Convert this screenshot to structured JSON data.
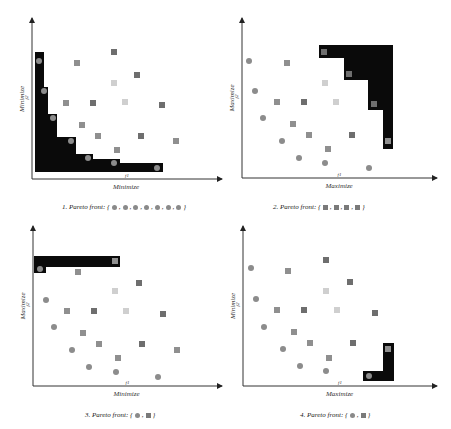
{
  "colors": {
    "front_fill": "#0a0a0a",
    "circle": "#8c8c8c",
    "square_dark": "#6e6e6e",
    "square_mid": "#8f8f8f",
    "square_light": "#cfcfcf",
    "axis": "#333333"
  },
  "panels": [
    {
      "id": 1,
      "caption": "1. Pareto front: {",
      "caption_end": "}",
      "front_symbols": [
        "circle",
        "circle",
        "circle",
        "circle",
        "circle",
        "circle",
        "circle"
      ],
      "x_axis_label": "Minimize",
      "y_axis_label": "Minimize",
      "x_tick": "f1",
      "y_tick": "f2",
      "axes": {
        "ox": 32,
        "oy": 179,
        "xend": 222,
        "ytop": 18
      },
      "front_polygon": [
        [
          35,
          52
        ],
        [
          44,
          52
        ],
        [
          44,
          87
        ],
        [
          48,
          87
        ],
        [
          48,
          114
        ],
        [
          57,
          114
        ],
        [
          57,
          137
        ],
        [
          76,
          137
        ],
        [
          76,
          154
        ],
        [
          93,
          154
        ],
        [
          93,
          159
        ],
        [
          120,
          159
        ],
        [
          120,
          163
        ],
        [
          163,
          163
        ],
        [
          163,
          172
        ],
        [
          35,
          172
        ]
      ],
      "circles": [
        [
          39,
          61
        ],
        [
          44,
          91
        ],
        [
          53,
          118
        ],
        [
          71,
          141
        ],
        [
          88,
          158
        ],
        [
          114,
          163
        ],
        [
          157,
          168
        ]
      ],
      "squares": [
        {
          "x": 114,
          "y": 52,
          "tone": "dark"
        },
        {
          "x": 77,
          "y": 63,
          "tone": "mid"
        },
        {
          "x": 137,
          "y": 75,
          "tone": "dark"
        },
        {
          "x": 114,
          "y": 83,
          "tone": "light"
        },
        {
          "x": 66,
          "y": 103,
          "tone": "mid"
        },
        {
          "x": 93,
          "y": 103,
          "tone": "dark"
        },
        {
          "x": 125,
          "y": 102,
          "tone": "light"
        },
        {
          "x": 162,
          "y": 105,
          "tone": "dark"
        },
        {
          "x": 82,
          "y": 125,
          "tone": "mid"
        },
        {
          "x": 98,
          "y": 136,
          "tone": "mid"
        },
        {
          "x": 141,
          "y": 136,
          "tone": "dark"
        },
        {
          "x": 176,
          "y": 141,
          "tone": "mid"
        },
        {
          "x": 117,
          "y": 150,
          "tone": "mid"
        }
      ],
      "caption_pos": {
        "x": 62,
        "y": 203
      }
    },
    {
      "id": 2,
      "caption": "2. Pareto front: {",
      "caption_end": "}",
      "front_symbols": [
        "square",
        "square",
        "square",
        "square"
      ],
      "x_axis_label": "Maximize",
      "y_axis_label": "Maximize",
      "x_tick": "f1",
      "y_tick": "f2",
      "axes": {
        "ox": 242,
        "oy": 178,
        "xend": 437,
        "ytop": 18
      },
      "front_polygon": [
        [
          319,
          45
        ],
        [
          393,
          45
        ],
        [
          393,
          149
        ],
        [
          383,
          149
        ],
        [
          383,
          110
        ],
        [
          368,
          110
        ],
        [
          368,
          80
        ],
        [
          344,
          80
        ],
        [
          344,
          58
        ],
        [
          319,
          58
        ]
      ],
      "circles": [
        [
          249,
          61
        ],
        [
          255,
          91
        ],
        [
          263,
          118
        ],
        [
          282,
          141
        ],
        [
          299,
          158
        ],
        [
          325,
          163
        ],
        [
          369,
          168
        ]
      ],
      "squares": [
        {
          "x": 324,
          "y": 52,
          "tone": "dark"
        },
        {
          "x": 287,
          "y": 63,
          "tone": "mid"
        },
        {
          "x": 349,
          "y": 74,
          "tone": "dark"
        },
        {
          "x": 325,
          "y": 83,
          "tone": "light"
        },
        {
          "x": 277,
          "y": 102,
          "tone": "mid"
        },
        {
          "x": 304,
          "y": 102,
          "tone": "dark"
        },
        {
          "x": 336,
          "y": 102,
          "tone": "light"
        },
        {
          "x": 374,
          "y": 104,
          "tone": "dark"
        },
        {
          "x": 293,
          "y": 124,
          "tone": "mid"
        },
        {
          "x": 309,
          "y": 135,
          "tone": "mid"
        },
        {
          "x": 352,
          "y": 135,
          "tone": "dark"
        },
        {
          "x": 388,
          "y": 141,
          "tone": "mid"
        },
        {
          "x": 328,
          "y": 149,
          "tone": "mid"
        }
      ],
      "caption_pos": {
        "x": 273,
        "y": 203
      }
    },
    {
      "id": 3,
      "caption": "3. Pareto front: {",
      "caption_end": "}",
      "front_symbols": [
        "circle",
        "square"
      ],
      "x_axis_label": "Minimize",
      "y_axis_label": "Maximize",
      "x_tick": "f1",
      "y_tick": "f2",
      "axes": {
        "ox": 33,
        "oy": 386,
        "xend": 222,
        "ytop": 226
      },
      "front_polygon": [
        [
          34,
          256
        ],
        [
          120,
          256
        ],
        [
          120,
          267
        ],
        [
          46,
          267
        ],
        [
          46,
          273
        ],
        [
          34,
          273
        ]
      ],
      "circles": [
        [
          40,
          269
        ],
        [
          46,
          300
        ],
        [
          54,
          327
        ],
        [
          72,
          350
        ],
        [
          89,
          367
        ],
        [
          116,
          372
        ],
        [
          158,
          377
        ]
      ],
      "squares": [
        {
          "x": 115,
          "y": 261,
          "tone": "mid"
        },
        {
          "x": 78,
          "y": 272,
          "tone": "mid"
        },
        {
          "x": 139,
          "y": 283,
          "tone": "dark"
        },
        {
          "x": 115,
          "y": 291,
          "tone": "light"
        },
        {
          "x": 67,
          "y": 311,
          "tone": "mid"
        },
        {
          "x": 94,
          "y": 311,
          "tone": "dark"
        },
        {
          "x": 126,
          "y": 311,
          "tone": "light"
        },
        {
          "x": 163,
          "y": 314,
          "tone": "dark"
        },
        {
          "x": 83,
          "y": 333,
          "tone": "mid"
        },
        {
          "x": 99,
          "y": 344,
          "tone": "mid"
        },
        {
          "x": 142,
          "y": 344,
          "tone": "dark"
        },
        {
          "x": 177,
          "y": 350,
          "tone": "mid"
        },
        {
          "x": 118,
          "y": 358,
          "tone": "mid"
        }
      ],
      "caption_pos": {
        "x": 85,
        "y": 411
      }
    },
    {
      "id": 4,
      "caption": "4. Pareto front: {",
      "caption_end": "}",
      "front_symbols": [
        "circle",
        "square"
      ],
      "x_axis_label": "Maximize",
      "y_axis_label": "Minimize",
      "x_tick": "f1",
      "y_tick": "f2",
      "axes": {
        "ox": 243,
        "oy": 386,
        "xend": 437,
        "ytop": 226
      },
      "front_polygon": [
        [
          363,
          371
        ],
        [
          383,
          371
        ],
        [
          383,
          343
        ],
        [
          394,
          343
        ],
        [
          394,
          381
        ],
        [
          363,
          381
        ]
      ],
      "circles": [
        [
          251,
          268
        ],
        [
          256,
          299
        ],
        [
          264,
          327
        ],
        [
          283,
          349
        ],
        [
          300,
          366
        ],
        [
          326,
          371
        ],
        [
          369,
          376
        ]
      ],
      "squares": [
        {
          "x": 326,
          "y": 260,
          "tone": "dark"
        },
        {
          "x": 288,
          "y": 271,
          "tone": "mid"
        },
        {
          "x": 350,
          "y": 282,
          "tone": "dark"
        },
        {
          "x": 326,
          "y": 291,
          "tone": "light"
        },
        {
          "x": 277,
          "y": 310,
          "tone": "mid"
        },
        {
          "x": 304,
          "y": 310,
          "tone": "dark"
        },
        {
          "x": 337,
          "y": 310,
          "tone": "light"
        },
        {
          "x": 375,
          "y": 313,
          "tone": "dark"
        },
        {
          "x": 294,
          "y": 332,
          "tone": "mid"
        },
        {
          "x": 310,
          "y": 343,
          "tone": "mid"
        },
        {
          "x": 353,
          "y": 343,
          "tone": "dark"
        },
        {
          "x": 388,
          "y": 349,
          "tone": "mid"
        },
        {
          "x": 329,
          "y": 358,
          "tone": "mid"
        }
      ],
      "caption_pos": {
        "x": 300,
        "y": 411
      }
    }
  ]
}
